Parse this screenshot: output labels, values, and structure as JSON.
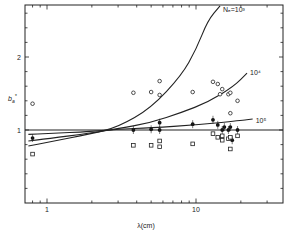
{
  "chart_data": {
    "type": "scatter",
    "title": "",
    "xlabel": "λ(cm)",
    "ylabel": "b*ₐ",
    "xscale": "log",
    "xlim": [
      0.71,
      34
    ],
    "ylim": [
      0,
      2.7
    ],
    "x_ticks": [
      {
        "value": 1,
        "label": "1"
      },
      {
        "value": 10,
        "label": "10"
      }
    ],
    "y_ticks": [
      {
        "value": 1,
        "label": "1"
      },
      {
        "value": 2,
        "label": "2"
      }
    ],
    "grid": false,
    "reference_line": {
      "y": 1
    },
    "curves": [
      {
        "name": "Ne=10³",
        "label": "Nₑ=10³",
        "points": [
          [
            0.75,
            0.78
          ],
          [
            1,
            0.83
          ],
          [
            2,
            0.95
          ],
          [
            3,
            1.04
          ],
          [
            5,
            1.3
          ],
          [
            8,
            1.75
          ],
          [
            10,
            2.1
          ],
          [
            12,
            2.5
          ],
          [
            14.5,
            2.7
          ]
        ]
      },
      {
        "name": "10⁴",
        "label": "10⁴",
        "points": [
          [
            0.75,
            0.85
          ],
          [
            1,
            0.88
          ],
          [
            2,
            0.96
          ],
          [
            3,
            1.02
          ],
          [
            5,
            1.1
          ],
          [
            8,
            1.24
          ],
          [
            12,
            1.38
          ],
          [
            18,
            1.6
          ],
          [
            22,
            1.78
          ]
        ]
      },
      {
        "name": "10⁵",
        "label": "10⁵",
        "points": [
          [
            0.75,
            0.94
          ],
          [
            1,
            0.95
          ],
          [
            2,
            0.98
          ],
          [
            3,
            1.01
          ],
          [
            5,
            1.03
          ],
          [
            10,
            1.07
          ],
          [
            20,
            1.13
          ],
          [
            24,
            1.15
          ]
        ]
      }
    ],
    "series": [
      {
        "name": "open circles",
        "marker": "circle-open",
        "points": [
          [
            0.8,
            1.36
          ],
          [
            3.8,
            1.51
          ],
          [
            5.0,
            1.52
          ],
          [
            5.7,
            1.67
          ],
          [
            5.7,
            1.48
          ],
          [
            9.5,
            1.52
          ],
          [
            13,
            1.66
          ],
          [
            14,
            1.63
          ],
          [
            15,
            1.56
          ],
          [
            14.5,
            1.49
          ],
          [
            16.5,
            1.49
          ],
          [
            17,
            1.51
          ],
          [
            19,
            1.4
          ],
          [
            17,
            1.23
          ]
        ]
      },
      {
        "name": "filled circles",
        "marker": "circle-filled",
        "points": [
          [
            0.8,
            0.89
          ],
          [
            3.8,
            1.0
          ],
          [
            5.0,
            1.01
          ],
          [
            5.7,
            1.1
          ],
          [
            5.7,
            1.0
          ],
          [
            9.5,
            1.08
          ],
          [
            13,
            1.14
          ],
          [
            14,
            1.07
          ],
          [
            15,
            1.0
          ],
          [
            15.5,
            1.04
          ],
          [
            16.5,
            1.0
          ],
          [
            17,
            1.04
          ],
          [
            17.5,
            0.86
          ],
          [
            19,
            1.0
          ]
        ]
      },
      {
        "name": "open squares",
        "marker": "square-open",
        "points": [
          [
            0.8,
            0.67
          ],
          [
            3.8,
            0.79
          ],
          [
            5.0,
            0.79
          ],
          [
            5.7,
            0.85
          ],
          [
            5.7,
            0.77
          ],
          [
            9.5,
            0.81
          ],
          [
            13,
            0.95
          ],
          [
            14,
            0.9
          ],
          [
            15,
            0.86
          ],
          [
            15,
            0.92
          ],
          [
            16.5,
            0.88
          ],
          [
            17,
            0.9
          ],
          [
            17,
            0.74
          ],
          [
            19,
            0.92
          ]
        ]
      }
    ]
  }
}
